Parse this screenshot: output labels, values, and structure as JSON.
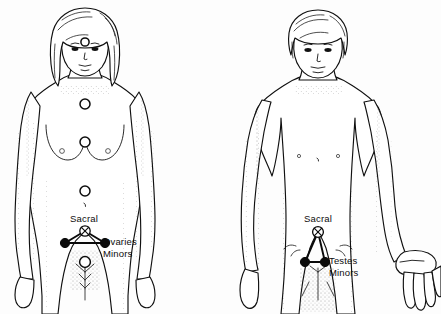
{
  "document": {
    "type": "anatomical-illustration",
    "subject": "Energy points on female and male body figures",
    "background_color": "#fdfdfd",
    "ink_color": "#101010"
  },
  "figures": [
    {
      "id": "female-figure",
      "sex": "female",
      "position": "left",
      "hair": "shoulder-length wavy",
      "posture": "standing, arms at sides, palms facing body",
      "crop": "head to mid-thigh",
      "labels": [
        {
          "id": "sacral",
          "text": "Sacral",
          "x": 84,
          "y": 222,
          "anchor": "middle"
        },
        {
          "id": "ovaries",
          "text": "Ovaries",
          "x": 103,
          "y": 245,
          "anchor": "start"
        },
        {
          "id": "minors",
          "text": "Minors",
          "x": 103,
          "y": 257,
          "anchor": "start"
        }
      ],
      "energy_points": [
        {
          "id": "brow-point",
          "type": "open-circle",
          "cx": 85,
          "cy": 42,
          "r": 4.1
        },
        {
          "id": "throat-point",
          "type": "open-circle",
          "cx": 85,
          "cy": 104,
          "r": 5.0
        },
        {
          "id": "heart-point",
          "type": "open-circle",
          "cx": 85,
          "cy": 142,
          "r": 5.0
        },
        {
          "id": "solar-plexus-point",
          "type": "open-circle",
          "cx": 85,
          "cy": 191,
          "r": 5.0
        },
        {
          "id": "sacral-point",
          "type": "crossed-circle",
          "cx": 85,
          "cy": 231,
          "r": 5.2
        },
        {
          "id": "ovary-point-left",
          "type": "filled-node",
          "cx": 65,
          "cy": 243,
          "r": 4.6
        },
        {
          "id": "ovary-point-right",
          "type": "filled-node",
          "cx": 105,
          "cy": 243,
          "r": 4.6
        },
        {
          "id": "root-point",
          "type": "open-circle",
          "cx": 85,
          "cy": 262,
          "r": 5.4
        }
      ],
      "connectors": [
        {
          "id": "sacral-to-left-ovary",
          "from": "sacral-point",
          "to": "ovary-point-left"
        },
        {
          "id": "sacral-to-right-ovary",
          "from": "sacral-point",
          "to": "ovary-point-right"
        },
        {
          "id": "ovary-to-ovary",
          "from": "ovary-point-left",
          "to": "ovary-point-right"
        }
      ]
    },
    {
      "id": "male-figure",
      "sex": "male",
      "position": "right",
      "hair": "short side-parted",
      "posture": "standing, arms slightly away from body, right hand open",
      "crop": "head to mid-thigh",
      "labels": [
        {
          "id": "sacral",
          "text": "Sacral",
          "x": 318,
          "y": 222,
          "anchor": "middle"
        },
        {
          "id": "testes",
          "text": "Testes",
          "x": 329,
          "y": 264,
          "anchor": "start"
        },
        {
          "id": "minors",
          "text": "Minors",
          "x": 329,
          "y": 276,
          "anchor": "start"
        }
      ],
      "energy_points": [
        {
          "id": "sacral-point",
          "type": "crossed-circle",
          "cx": 318,
          "cy": 232,
          "r": 5.4
        },
        {
          "id": "testis-point-left",
          "type": "filled-node",
          "cx": 305,
          "cy": 262,
          "r": 4.6
        },
        {
          "id": "testis-point-right",
          "type": "filled-node",
          "cx": 325,
          "cy": 262,
          "r": 4.6
        }
      ],
      "connectors": [
        {
          "id": "sacral-to-left-testis",
          "from": "sacral-point",
          "to": "testis-point-left"
        },
        {
          "id": "sacral-to-right-testis",
          "from": "sacral-point",
          "to": "testis-point-right"
        },
        {
          "id": "testis-to-testis",
          "from": "testis-point-left",
          "to": "testis-point-right"
        }
      ]
    }
  ],
  "legend": {
    "crossed_circle_meaning": "Sacral centre",
    "filled_node_meaning": "Minor gonadal point"
  }
}
